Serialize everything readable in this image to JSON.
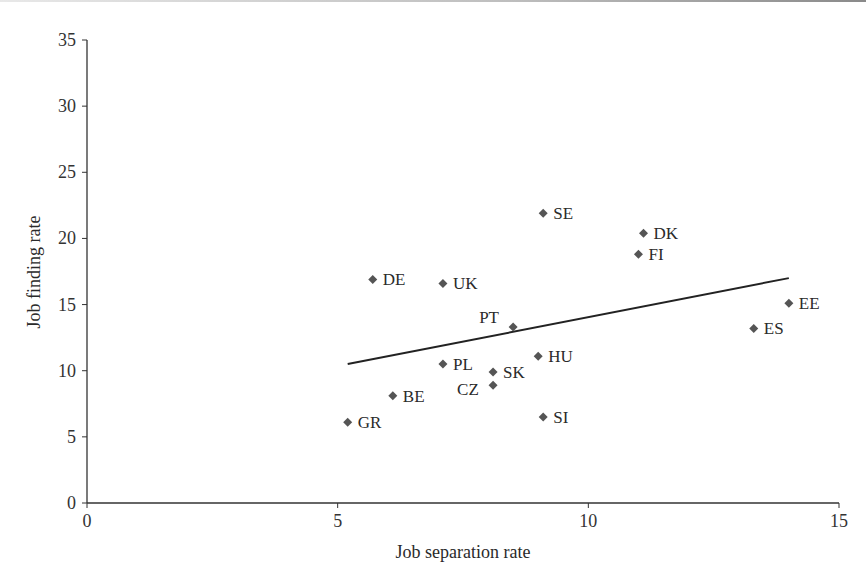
{
  "chart_data": {
    "type": "scatter",
    "title": "",
    "xlabel": "Job separation rate",
    "ylabel": "Job finding rate",
    "xlim": [
      0,
      15
    ],
    "ylim": [
      0,
      35
    ],
    "x_ticks": [
      0,
      5,
      10,
      15
    ],
    "y_ticks": [
      0,
      5,
      10,
      15,
      20,
      25,
      30,
      35
    ],
    "grid": false,
    "legend": null,
    "marker": "diamond",
    "marker_color": "#555555",
    "points": [
      {
        "label": "GR",
        "x": 5.2,
        "y": 6.1
      },
      {
        "label": "BE",
        "x": 6.1,
        "y": 8.1
      },
      {
        "label": "DE",
        "x": 5.7,
        "y": 16.9
      },
      {
        "label": "UK",
        "x": 7.1,
        "y": 16.6
      },
      {
        "label": "PT",
        "x": 8.5,
        "y": 13.3
      },
      {
        "label": "PL",
        "x": 7.1,
        "y": 10.5
      },
      {
        "label": "SK",
        "x": 8.1,
        "y": 9.9
      },
      {
        "label": "CZ",
        "x": 8.1,
        "y": 8.9
      },
      {
        "label": "HU",
        "x": 9.0,
        "y": 11.1
      },
      {
        "label": "SI",
        "x": 9.1,
        "y": 6.5
      },
      {
        "label": "SE",
        "x": 9.1,
        "y": 21.9
      },
      {
        "label": "DK",
        "x": 11.1,
        "y": 20.4
      },
      {
        "label": "FI",
        "x": 11.0,
        "y": 18.8
      },
      {
        "label": "EE",
        "x": 14.0,
        "y": 15.1
      },
      {
        "label": "ES",
        "x": 13.3,
        "y": 13.2
      }
    ],
    "trendline": {
      "type": "linear",
      "x0": 5.2,
      "y0": 10.5,
      "x1": 14.0,
      "y1": 17.0
    }
  }
}
